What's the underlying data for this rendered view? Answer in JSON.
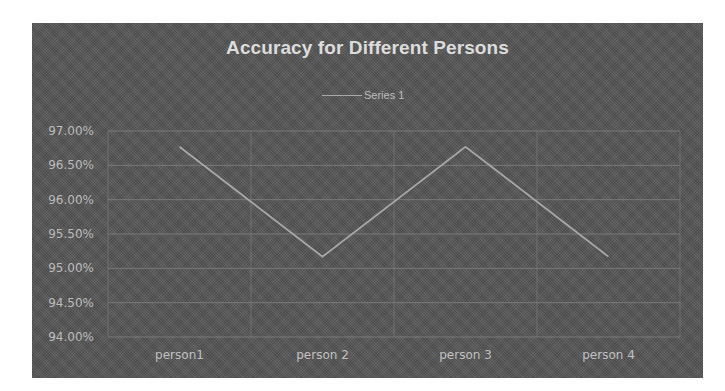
{
  "chart_data": {
    "type": "line",
    "title": "Accuracy for Different Persons",
    "categories": [
      "person1",
      "person 2",
      "person 3",
      "person 4"
    ],
    "series": [
      {
        "name": "Series 1",
        "values": [
          96.77,
          95.17,
          96.77,
          95.17
        ]
      }
    ],
    "xlabel": "",
    "ylabel": "",
    "ylim": [
      94.0,
      97.0
    ],
    "yticks": [
      97.0,
      96.5,
      96.0,
      95.5,
      95.0,
      94.5,
      94.0
    ],
    "ytick_labels": [
      "97.00%",
      "96.50%",
      "96.00%",
      "95.50%",
      "95.00%",
      "94.50%",
      "94.00%"
    ],
    "grid": true,
    "legend_position": "top"
  },
  "colors": {
    "background": "#5a5a5a",
    "line": "#a8a8a8",
    "grid": "#7a7a7a",
    "text": "#c0c0c0"
  }
}
